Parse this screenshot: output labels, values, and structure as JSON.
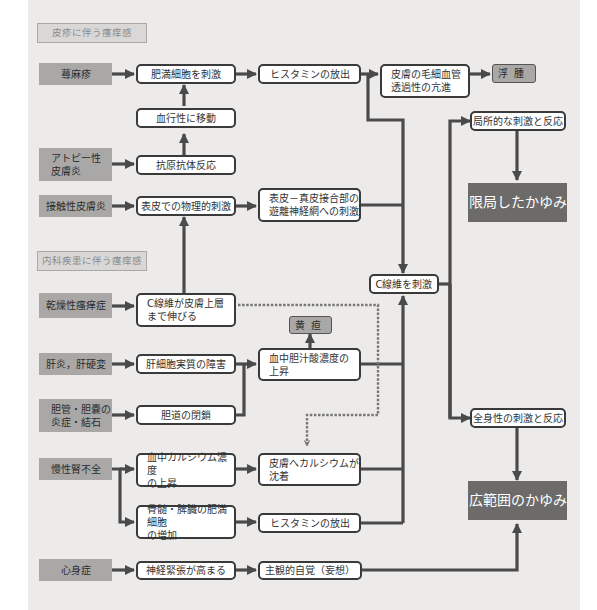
{
  "sections": {
    "skin": "皮疹に伴う瘙痒感",
    "internal": "内科疾患に伴う瘙痒感"
  },
  "causes": {
    "urticaria": "蕁麻疹",
    "atopic": "アトピー性\n皮膚炎",
    "contact": "接触性皮膚炎",
    "xerotic": "乾燥性瘙痒症",
    "hepatitis": "肝炎，肝硬変",
    "biliary": "胆管・胆嚢の\n炎症・結石",
    "renal": "慢性腎不全",
    "psychosomatic": "心身症"
  },
  "processes": {
    "mast_stim": "肥満細胞を刺激",
    "blood_migration": "血行性に移動",
    "antigen_antibody": "抗原抗体反応",
    "physical_stim": "表皮での物理的刺激",
    "histamine_top": "ヒスタミンの放出",
    "capillary": "皮膚の毛細血管\n透過性の亢進",
    "dej_nerve": "表皮－真皮接合部の\n遊離神経網への刺激",
    "c_fiber_extend": "C線維が皮膚上層\nまで伸びる",
    "hepatocyte": "肝細胞実質の障害",
    "bile_obstruction": "胆道の閉鎖",
    "bile_acid": "血中胆汁酸濃度の\n上昇",
    "calcium_rise": "血中カルシウム濃度\nの上昇",
    "mast_increase": "骨髄・脾臓の肥満細胞\nの増加",
    "calcium_deposit": "皮膚へカルシウムが\n沈着",
    "histamine_bottom": "ヒスタミンの放出",
    "nerve_tension": "神経緊張が高まる",
    "subjective": "主観的自覚（妄想）",
    "c_fiber_stim": "C線維を刺激",
    "local_reaction": "局所的な刺激と反応",
    "systemic_reaction": "全身性の刺激と反応"
  },
  "symptoms": {
    "edema": "浮腫",
    "jaundice": "黄疸"
  },
  "outcomes": {
    "localized_itch": "限局したかゆみ",
    "widespread_itch": "広範囲のかゆみ"
  },
  "colors": {
    "panel": "#ecebea",
    "cause_fill": "#a9a8a7",
    "outcome_fill": "#6c6b6a",
    "line": "#4a4a4a"
  }
}
